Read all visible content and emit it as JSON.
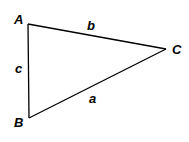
{
  "diagram": {
    "type": "triangle",
    "vertices": [
      {
        "id": "A",
        "label": "A",
        "x": 28,
        "y": 24,
        "label_x": 14,
        "label_y": 24
      },
      {
        "id": "B",
        "label": "B",
        "x": 29,
        "y": 118,
        "label_x": 14,
        "label_y": 127
      },
      {
        "id": "C",
        "label": "C",
        "x": 166,
        "y": 49,
        "label_x": 172,
        "label_y": 54
      }
    ],
    "sides": [
      {
        "id": "b",
        "label": "b",
        "from": "A",
        "to": "C",
        "label_x": 87,
        "label_y": 30
      },
      {
        "id": "c",
        "label": "c",
        "from": "A",
        "to": "B",
        "label_x": 15,
        "label_y": 73
      },
      {
        "id": "a",
        "label": "a",
        "from": "B",
        "to": "C",
        "label_x": 89,
        "label_y": 103
      }
    ],
    "stroke_color": "#000000",
    "background": "#ffffff"
  }
}
